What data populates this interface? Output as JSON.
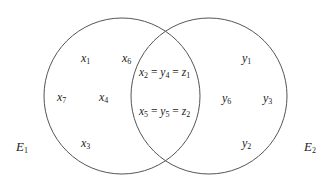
{
  "diagram": {
    "type": "venn",
    "sets": [
      {
        "name": "E",
        "sub": "1",
        "color": "#555555"
      },
      {
        "name": "E",
        "sub": "2",
        "color": "#555555"
      }
    ],
    "left_only": [
      {
        "v": "x",
        "s": "1"
      },
      {
        "v": "x",
        "s": "6"
      },
      {
        "v": "x",
        "s": "7"
      },
      {
        "v": "x",
        "s": "4"
      },
      {
        "v": "x",
        "s": "3"
      }
    ],
    "intersection": [
      {
        "a": "x",
        "as": "2",
        "b": "y",
        "bs": "4",
        "c": "z",
        "cs": "1"
      },
      {
        "a": "x",
        "as": "5",
        "b": "y",
        "bs": "5",
        "c": "z",
        "cs": "2"
      }
    ],
    "right_only": [
      {
        "v": "y",
        "s": "1"
      },
      {
        "v": "y",
        "s": "6"
      },
      {
        "v": "y",
        "s": "3"
      },
      {
        "v": "y",
        "s": "2"
      }
    ],
    "eq_sign": "="
  }
}
